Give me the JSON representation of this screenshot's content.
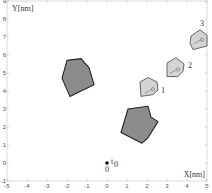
{
  "chart_data": {
    "type": "scatter",
    "title": "",
    "xlabel": "X[nm]",
    "ylabel": "Y[nm]",
    "xlim": [
      -5,
      5
    ],
    "ylim": [
      -1,
      9
    ],
    "xticks": [
      -5,
      -4,
      -3,
      -2,
      -1,
      0,
      1,
      2,
      3,
      4,
      5
    ],
    "yticks": [
      -1,
      0,
      1,
      2,
      3,
      4,
      5,
      6,
      7,
      8,
      9
    ],
    "grid": false,
    "legend": null,
    "obstacles": [
      {
        "name": "obstacle-left",
        "fill": "#8c8c8c",
        "stroke": "#222222",
        "points": [
          [
            -2.0,
            5.7
          ],
          [
            -1.3,
            5.8
          ],
          [
            -0.9,
            5.3
          ],
          [
            -0.65,
            4.35
          ],
          [
            -1.4,
            3.95
          ],
          [
            -1.85,
            3.7
          ],
          [
            -2.25,
            4.7
          ]
        ]
      },
      {
        "name": "obstacle-lower",
        "fill": "#8c8c8c",
        "stroke": "#222222",
        "points": [
          [
            1.05,
            3.0
          ],
          [
            2.05,
            3.15
          ],
          [
            2.2,
            2.55
          ],
          [
            2.55,
            2.3
          ],
          [
            2.05,
            1.4
          ],
          [
            1.75,
            1.1
          ],
          [
            0.7,
            1.7
          ]
        ]
      }
    ],
    "robots": [
      {
        "label": "1",
        "fill": "#d4d4d4",
        "stroke": "#444444",
        "points": [
          [
            1.65,
            4.5
          ],
          [
            2.05,
            4.75
          ],
          [
            2.5,
            4.5
          ],
          [
            2.55,
            4.05
          ],
          [
            2.3,
            3.8
          ],
          [
            1.7,
            3.7
          ]
        ],
        "marker": [
          2.3,
          4.1
        ],
        "label_pos": [
          2.7,
          3.9
        ]
      },
      {
        "label": "2",
        "fill": "#d4d4d4",
        "stroke": "#444444",
        "points": [
          [
            3.0,
            5.55
          ],
          [
            3.45,
            5.85
          ],
          [
            3.85,
            5.5
          ],
          [
            3.8,
            5.1
          ],
          [
            3.55,
            4.8
          ],
          [
            3.0,
            4.8
          ]
        ],
        "marker": [
          3.55,
          5.2
        ],
        "label_pos": [
          4.05,
          5.3
        ]
      },
      {
        "label": "3",
        "fill": "#d4d4d4",
        "stroke": "#444444",
        "points": [
          [
            4.2,
            7.05
          ],
          [
            4.65,
            7.4
          ],
          [
            5.0,
            7.1
          ],
          [
            5.0,
            6.5
          ],
          [
            4.3,
            6.3
          ],
          [
            4.15,
            6.65
          ]
        ],
        "marker": [
          4.75,
          6.85
        ],
        "label_pos": [
          4.65,
          7.6
        ]
      }
    ],
    "start_point": {
      "x": 0,
      "y": 0,
      "label": "t",
      "subscript": "0",
      "origin_label": "0"
    }
  }
}
